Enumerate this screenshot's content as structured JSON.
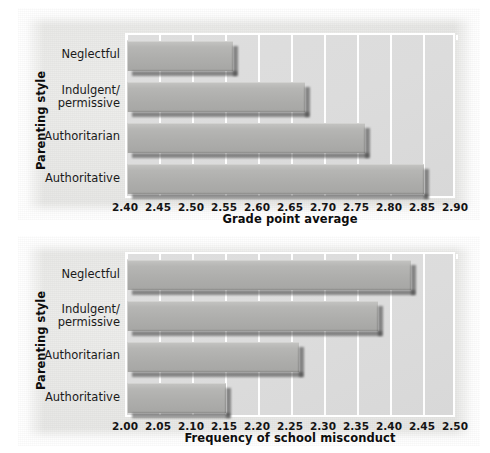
{
  "figure": {
    "y_axis_title": "Parenting style",
    "categories": [
      "Neglectful",
      "Indulgent/\npermissive",
      "Authoritarian",
      "Authoritative"
    ]
  },
  "chart_data": [
    {
      "type": "bar",
      "orientation": "horizontal",
      "title": "",
      "xlabel": "Grade point average",
      "ylabel": "Parenting style",
      "categories": [
        "Neglectful",
        "Indulgent/permissive",
        "Authoritarian",
        "Authoritative"
      ],
      "values": [
        2.56,
        2.67,
        2.76,
        2.85
      ],
      "xlim": [
        2.4,
        2.9
      ],
      "xticks": [
        2.4,
        2.45,
        2.5,
        2.55,
        2.6,
        2.65,
        2.7,
        2.75,
        2.8,
        2.85,
        2.9
      ],
      "xticklabels": [
        "2.40",
        "2.45",
        "2.50",
        "2.55",
        "2.60",
        "2.65",
        "2.70",
        "2.75",
        "2.80",
        "2.85",
        "2.90"
      ],
      "grid": true,
      "grid_color": "#ffffff",
      "bar_color": "#b2b2b0",
      "plot_bg": "#dcdcdc",
      "legend": null
    },
    {
      "type": "bar",
      "orientation": "horizontal",
      "title": "",
      "xlabel": "Frequency of school misconduct",
      "ylabel": "Parenting style",
      "categories": [
        "Neglectful",
        "Indulgent/permissive",
        "Authoritarian",
        "Authoritative"
      ],
      "values": [
        2.43,
        2.38,
        2.26,
        2.15
      ],
      "xlim": [
        2.0,
        2.5
      ],
      "xticks": [
        2.0,
        2.05,
        2.1,
        2.15,
        2.2,
        2.25,
        2.3,
        2.35,
        2.4,
        2.45,
        2.5
      ],
      "xticklabels": [
        "2.00",
        "2.05",
        "2.10",
        "2.15",
        "2.20",
        "2.25",
        "2.30",
        "2.35",
        "2.40",
        "2.45",
        "2.50"
      ],
      "grid": true,
      "grid_color": "#ffffff",
      "bar_color": "#b2b2b0",
      "plot_bg": "#dcdcdc",
      "legend": null
    }
  ]
}
